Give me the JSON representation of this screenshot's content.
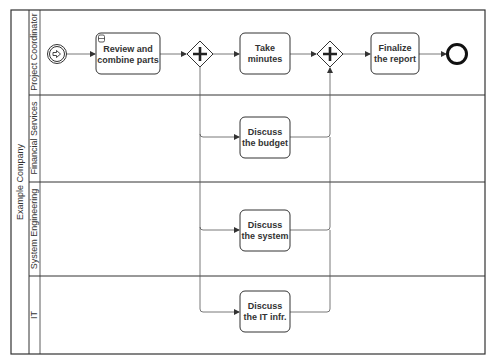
{
  "pool": {
    "label": "Example Company",
    "lanes": [
      {
        "id": "lane-project-coordinator",
        "label": "Project Coordinator"
      },
      {
        "id": "lane-financial-services",
        "label": "Financial Services"
      },
      {
        "id": "lane-system-engineering",
        "label": "System Engineering"
      },
      {
        "id": "lane-it",
        "label": "IT"
      }
    ]
  },
  "events": {
    "start": {
      "type": "start-event",
      "icon": "message-arrow-icon"
    },
    "end": {
      "type": "end-event"
    }
  },
  "tasks": {
    "review": {
      "line1": "Review and",
      "line2": "combine parts",
      "marker": "subprocess-icon"
    },
    "minutes": {
      "line1": "Take",
      "line2": "minutes"
    },
    "finalize": {
      "line1": "Finalize",
      "line2": "the report"
    },
    "budget": {
      "line1": "Discuss",
      "line2": "the budget"
    },
    "system": {
      "line1": "Discuss",
      "line2": "the system"
    },
    "it": {
      "line1": "Discuss",
      "line2": "the IT infr."
    }
  },
  "gateways": {
    "split": {
      "type": "parallel",
      "icon": "plus-icon"
    },
    "join": {
      "type": "parallel",
      "icon": "plus-icon"
    }
  },
  "colors": {
    "stroke": "#333333",
    "line": "#555555",
    "background": "#ffffff"
  }
}
